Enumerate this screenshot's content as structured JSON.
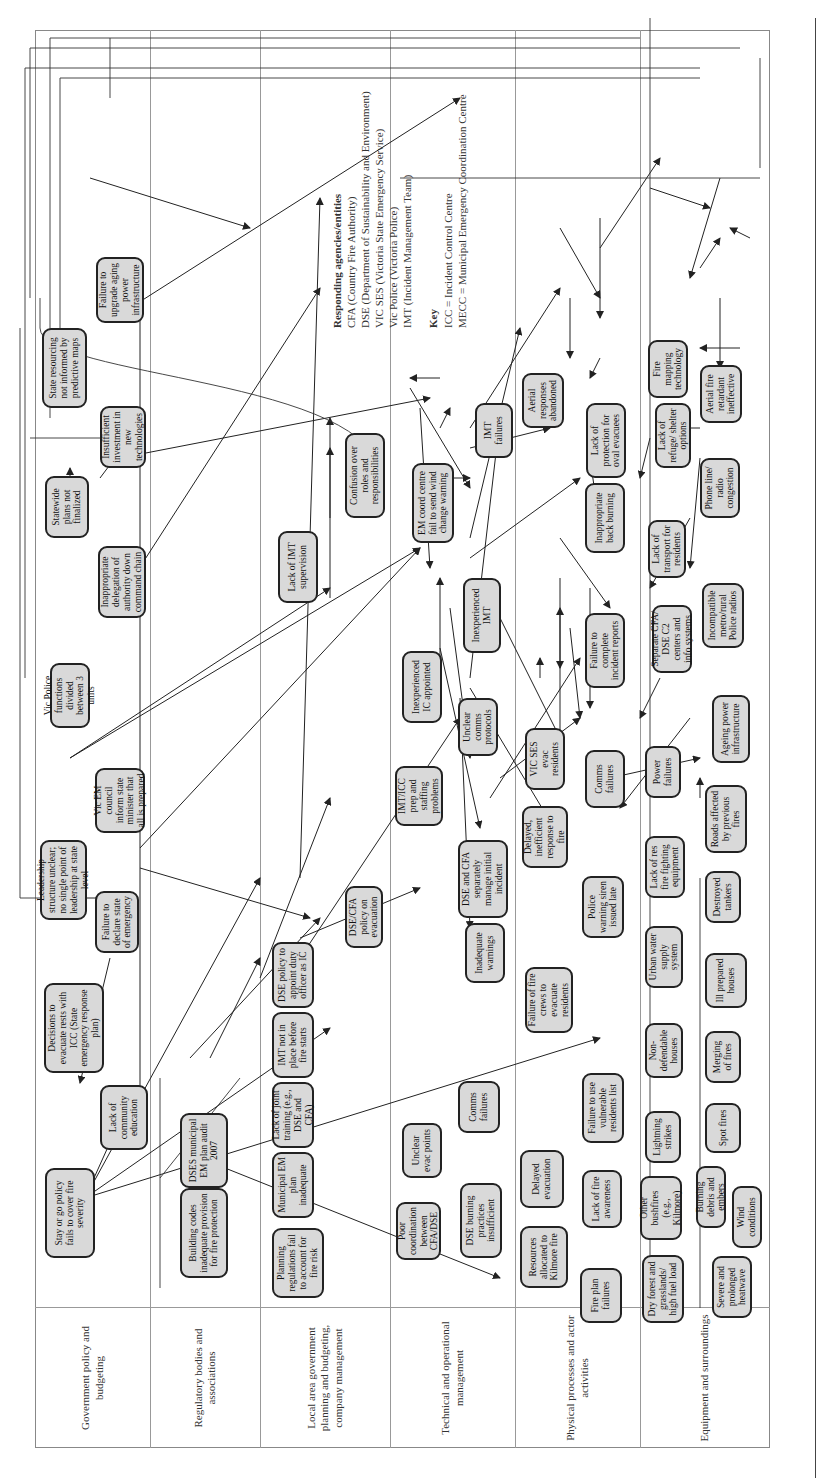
{
  "legend": {
    "agencies_title": "Responding agencies/entities",
    "agencies": [
      "CFA (Country Fire Authority)",
      "DSE (Department of Sustainability and Environment)",
      "VIC SES (Victoria State Emergency Service)",
      "Vic Police (Victoria Police)",
      "IMT (Incident Management Team)"
    ],
    "key_title": "Key",
    "key": [
      "ICC = Incident Control Centre",
      "MECC = Municipal Emergency Coordination Centre"
    ]
  },
  "lanes": [
    {
      "label": "Government policy and budgeting"
    },
    {
      "label": "Regulatory bodies and associations"
    },
    {
      "label": "Local area government planning and budgeting, company management"
    },
    {
      "label": "Technical and operational management"
    },
    {
      "label": "Physical processes and actor activities"
    },
    {
      "label": "Equipment and surroundings"
    }
  ],
  "nodes": {
    "stay_or_go": "Stay or go policy fails to cover fire severity",
    "lack_community_ed": "Lack of community education",
    "decisions_evacuate": "Decisions to evacuate rests with ICC (State emergency response plan)",
    "failure_declare": "Failure to declare state of emergency",
    "leadership_structure": "Leadership structure unclear; no single point of leadership at state level",
    "vic_em_council": "Vic EM council inform state minister that all is prepared",
    "vic_police_functions": "Vic Police functions divided between 3 units",
    "inappropriate_delegation": "Inappropriate delegation of authority down command chain",
    "statewide_plans": "Statewide plans not finalized",
    "insufficient_investment": "Insufficient investment in new technologies",
    "state_resourcing": "State resourcing not informed by predictive maps",
    "failure_upgrade_power": "Failure to upgrade aging power infrastructure",
    "building_codes": "Building codes inadequate provision for fire protection",
    "dses_audit": "DSES municipal EM plan audit 2007",
    "planning_regs": "Planning regulations fail to account for fire risk",
    "municipal_em": "Municipal EM plan inadequate",
    "lack_joint_training": "Lack of joint training (e.g., DSE and CFA)",
    "imt_not_in_place": "IMT not in place before fire starts",
    "dse_policy_duty": "DSE policy to appoint duty officer as IC",
    "lack_imt_supervision": "Lack of IMT supervision",
    "confusion_roles": "Confusion over roles and responsibilities",
    "poor_coordination": "Poor coordination between CFA/DSE",
    "unclear_evac": "Unclear evac points",
    "dse_burning": "DSE burning practices insufficient",
    "comms_failures_tech": "Comms failures",
    "inadequate_warnings": "Inadequate warnings",
    "dse_cfa_policy_evac": "DSE/CFA policy on evacuation",
    "imt_icc_prep": "IMT/ICC prep and staffing problems",
    "dse_cfa_separately": "DSE and CFA separately manage initial incident",
    "inexperienced_ic": "Inexperienced IC appointed",
    "unclear_comms": "Unclear comms protocols",
    "em_coord_centre": "EM coord centre fail to send wind change warning",
    "inexperienced_imt": "Inexperienced IMT",
    "imt_failures": "IMT failures",
    "resources_kilmore": "Resources allocated to Kilmore fire",
    "fire_plan_failures": "Fire plan failures",
    "delayed_evacuation": "Delayed evacuation",
    "lack_fire_awareness": "Lack of fire awareness",
    "failure_vulnerable": "Failure to use vulnerable residents list",
    "failure_fire_crews": "Failure of fire crews to evacuate residents",
    "police_siren": "Police warning siren issued late",
    "delayed_response": "Delayed, inefficient response to fire",
    "vic_ses_evac": "VIC SES evac residents",
    "comms_failures_phys": "Comms failures",
    "failure_incident_reports": "Failure to complete incident reports",
    "inappropriate_back_burning": "Inappropriate back burning",
    "aerial_abandoned": "Aerial responses abandoned",
    "lack_protection_oval": "Lack of protection for oval evacuees",
    "dry_forest": "Dry forest and grasslands/ high fuel load",
    "severe_heatwave": "Severe and prolonged heatwave",
    "other_bushfires": "Other bushfires (e.g., Kilmore)",
    "burning_debris": "Burning debris and embers",
    "wind_conditions": "Wind conditions",
    "lightning": "Lightning strikes",
    "spot_fires": "Spot fires",
    "merging_fires": "Merging of fires",
    "non_defendable": "Non-defendable houses",
    "ill_prepared": "Ill prepared houses",
    "urban_water": "Urban water supply system",
    "destroyed_tankers": "Destroyed tankers",
    "lack_res_equipment": "Lack of res fire fighting equipment",
    "roads_affected": "Roads affected by previous fires",
    "power_failures": "Power failures",
    "ageing_power": "Ageing power infrastructure",
    "separate_cfa_dse": "Separate CFA/ DSE C2 centers and info systems",
    "incompatible_radios": "Incompatible metro/rural Police radios",
    "lack_transport": "Lack of transport for residents",
    "phone_radio": "Phone line/ radio congestion",
    "lack_refuge": "Lack of refuge/ shelter options",
    "aerial_retardant": "Aerial fire retardant ineffective",
    "fire_mapping": "Fire mapping technology"
  },
  "colors": {
    "node_fill": "#d9d9d9",
    "node_border": "#222222",
    "edge": "#222222",
    "lane_line": "#999999"
  }
}
